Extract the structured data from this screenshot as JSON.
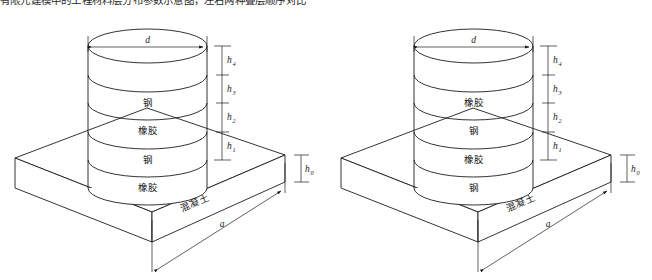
{
  "page": {
    "top_caption": "有限元建模中的工程材料层分布参数示意图，左右两种叠层顺序对比",
    "width": 652,
    "height": 280,
    "line_color": "#1c1c1c",
    "background": "#ffffff"
  },
  "diagrams": [
    {
      "id": "left",
      "name": "left-bearing-diagram",
      "layers": [
        {
          "index": 0,
          "label": "",
          "position": "top-cap"
        },
        {
          "index": 1,
          "label": "钢",
          "material": "steel"
        },
        {
          "index": 2,
          "label": "橡胶",
          "material": "rubber"
        },
        {
          "index": 3,
          "label": "钢",
          "material": "steel"
        },
        {
          "index": 4,
          "label": "橡胶",
          "material": "rubber"
        }
      ],
      "base_label": "混凝土",
      "diameter_label": "d",
      "width_label": "a",
      "slab_thickness_label": "h",
      "slab_thickness_sub": "0",
      "height_dims": [
        {
          "label": "h",
          "sub": "4"
        },
        {
          "label": "h",
          "sub": "3"
        },
        {
          "label": "h",
          "sub": "2"
        },
        {
          "label": "h",
          "sub": "1"
        }
      ]
    },
    {
      "id": "right",
      "name": "right-bearing-diagram",
      "layers": [
        {
          "index": 0,
          "label": "",
          "position": "top-cap"
        },
        {
          "index": 1,
          "label": "橡胶",
          "material": "rubber"
        },
        {
          "index": 2,
          "label": "钢",
          "material": "steel"
        },
        {
          "index": 3,
          "label": "橡胶",
          "material": "rubber"
        },
        {
          "index": 4,
          "label": "钢",
          "material": "steel"
        }
      ],
      "base_label": "混凝土",
      "diameter_label": "d",
      "width_label": "a",
      "slab_thickness_label": "h",
      "slab_thickness_sub": "0",
      "height_dims": [
        {
          "label": "h",
          "sub": "4"
        },
        {
          "label": "h",
          "sub": "3"
        },
        {
          "label": "h",
          "sub": "2"
        },
        {
          "label": "h",
          "sub": "1"
        }
      ]
    }
  ]
}
